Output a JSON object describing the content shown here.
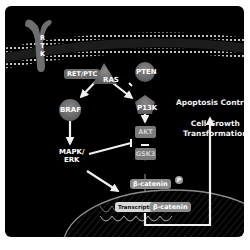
{
  "diagram": {
    "membrane_receptor": {
      "label": "R\nT\nK",
      "letters": [
        "R",
        "T",
        "K"
      ]
    },
    "nodes": {
      "ret_ptc": "RET/PTC",
      "ras": "RAS",
      "pten": "PTEN",
      "braf": "BRAF",
      "pi3k": "P13K",
      "akt": "AKT",
      "gsk3": "GSK3",
      "mapk_erk_line1": "MAPK/",
      "mapk_erk_line2": "ERK",
      "beta_catenin_p": "β-catenin",
      "phospho_badge": "P",
      "transcription": "Transcription",
      "beta_catenin_nuclear": "β-catenin"
    },
    "outcomes": {
      "apoptosis": "Apoptosis Control",
      "growth_line1": "Cell Growth",
      "growth_line2": "Transformation"
    },
    "edges": [
      {
        "from": "RET/PTC",
        "to": "RAS",
        "type": "activation"
      },
      {
        "from": "RAS",
        "to": "BRAF",
        "type": "activation"
      },
      {
        "from": "RAS",
        "to": "P13K",
        "type": "activation"
      },
      {
        "from": "PTEN",
        "to": "P13K",
        "type": "inhibition"
      },
      {
        "from": "BRAF",
        "to": "MAPK/ERK",
        "type": "activation"
      },
      {
        "from": "P13K",
        "to": "AKT",
        "type": "activation"
      },
      {
        "from": "AKT",
        "to": "GSK3",
        "type": "inhibition"
      },
      {
        "from": "MAPK/ERK",
        "to": "GSK3",
        "type": "inhibition"
      },
      {
        "from": "GSK3",
        "to": "β-catenin",
        "type": "activation"
      },
      {
        "from": "MAPK/ERK",
        "to": "Transcription",
        "type": "activation"
      },
      {
        "from": "β-catenin (nucleus)",
        "to": "Cell Growth Transformation",
        "type": "activation"
      }
    ],
    "colors": {
      "background": "#000000",
      "node_gray": "#7b7b7b",
      "arrow": "#f0f0f0",
      "nucleus_outline": "#8c8c8c"
    }
  }
}
